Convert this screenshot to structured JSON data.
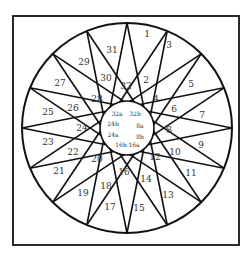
{
  "diagram": {
    "frame": {
      "x": 13,
      "y": 16,
      "width": 226,
      "height": 229
    },
    "circle": {
      "cx": 127,
      "cy": 128,
      "r": 105,
      "inner_r": 27
    },
    "star": {
      "points": 16,
      "step": 7
    },
    "outer_labels": [
      {
        "text": "1",
        "x": 147,
        "y": 34
      },
      {
        "text": "3",
        "x": 169,
        "y": 45
      },
      {
        "text": "5",
        "x": 191,
        "y": 84
      },
      {
        "text": "7",
        "x": 202,
        "y": 115
      },
      {
        "text": "9",
        "x": 201,
        "y": 145
      },
      {
        "text": "11",
        "x": 191,
        "y": 173
      },
      {
        "text": "13",
        "x": 168,
        "y": 195
      },
      {
        "text": "15",
        "x": 139,
        "y": 208
      },
      {
        "text": "17",
        "x": 110,
        "y": 207
      },
      {
        "text": "19",
        "x": 83,
        "y": 193
      },
      {
        "text": "21",
        "x": 59,
        "y": 171
      },
      {
        "text": "23",
        "x": 48,
        "y": 142
      },
      {
        "text": "25",
        "x": 48,
        "y": 112
      },
      {
        "text": "27",
        "x": 60,
        "y": 83
      },
      {
        "text": "29",
        "x": 84,
        "y": 62
      },
      {
        "text": "31",
        "x": 112,
        "y": 50
      }
    ],
    "arm_labels": [
      {
        "text": "2",
        "x": 146,
        "y": 80
      },
      {
        "text": "4",
        "x": 156,
        "y": 99
      },
      {
        "text": "6",
        "x": 174,
        "y": 109
      },
      {
        "text": "8",
        "x": 169,
        "y": 130
      },
      {
        "text": "10",
        "x": 175,
        "y": 152
      },
      {
        "text": "12",
        "x": 155,
        "y": 157
      },
      {
        "text": "14",
        "x": 146,
        "y": 179
      },
      {
        "text": "16",
        "x": 124,
        "y": 172
      },
      {
        "text": "18",
        "x": 106,
        "y": 186
      },
      {
        "text": "20",
        "x": 97,
        "y": 159
      },
      {
        "text": "22",
        "x": 73,
        "y": 152
      },
      {
        "text": "24",
        "x": 82,
        "y": 128
      },
      {
        "text": "26",
        "x": 73,
        "y": 108
      },
      {
        "text": "28",
        "x": 97,
        "y": 99
      },
      {
        "text": "30",
        "x": 106,
        "y": 78
      },
      {
        "text": "32",
        "x": 126,
        "y": 86
      }
    ],
    "inner_labels": [
      {
        "text": "32a",
        "x": 117,
        "y": 114
      },
      {
        "text": "32b",
        "x": 135,
        "y": 114
      },
      {
        "text": "24b",
        "x": 113,
        "y": 124
      },
      {
        "text": "8a",
        "x": 140,
        "y": 126
      },
      {
        "text": "24a",
        "x": 113,
        "y": 135
      },
      {
        "text": "8b",
        "x": 140,
        "y": 137
      },
      {
        "text": "16b",
        "x": 121,
        "y": 145
      },
      {
        "text": "16a",
        "x": 134,
        "y": 145
      }
    ]
  }
}
